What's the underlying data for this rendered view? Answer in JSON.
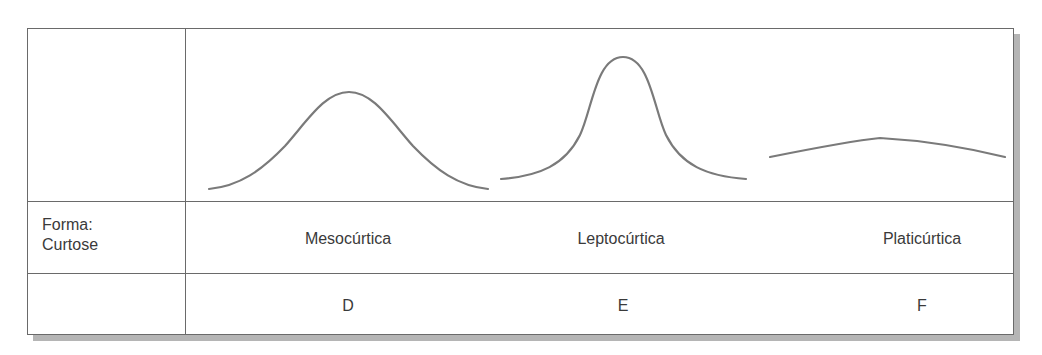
{
  "table": {
    "row_header": {
      "line1": "Forma:",
      "line2": "Curtose"
    },
    "columns": [
      {
        "shape_label": "Mesocúrtica",
        "letter": "D",
        "curve": "mesokurtic-bell-curve"
      },
      {
        "shape_label": "Leptocúrtica",
        "letter": "E",
        "curve": "leptokurtic-bell-curve"
      },
      {
        "shape_label": "Platicúrtica",
        "letter": "F",
        "curve": "platykurtic-bell-curve"
      }
    ]
  },
  "colors": {
    "border": "#6a6a6a",
    "curve_stroke": "#7a7a7a",
    "shadow": "#b5b5b5",
    "text": "#3a3a3a"
  }
}
